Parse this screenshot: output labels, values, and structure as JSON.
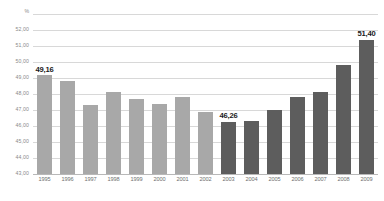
{
  "chart_data": {
    "type": "bar",
    "title": "",
    "subtitle": "",
    "xlabel": "",
    "ylabel": "",
    "unit_label": "%",
    "ylim": [
      43.0,
      53.0
    ],
    "ytick_step": 1.0,
    "ytick_labels": [
      "53,00",
      "52,00",
      "51,00",
      "50,00",
      "49,00",
      "48,00",
      "47,00",
      "46,00",
      "45,00",
      "44,00",
      "43,00"
    ],
    "ytick_values": [
      53.0,
      52.0,
      51.0,
      50.0,
      49.0,
      48.0,
      47.0,
      46.0,
      45.0,
      44.0,
      43.0
    ],
    "grid": true,
    "legend": "none",
    "decimal_separator": ",",
    "categories": [
      "1995",
      "1996",
      "1997",
      "1998",
      "1999",
      "2000",
      "2001",
      "2002",
      "2003",
      "2004",
      "2005",
      "2006",
      "2007",
      "2008",
      "2009"
    ],
    "values": [
      49.16,
      48.8,
      47.3,
      48.1,
      47.7,
      47.4,
      47.8,
      46.9,
      46.26,
      46.3,
      47.0,
      47.8,
      48.1,
      49.8,
      51.4
    ],
    "bars": [
      {
        "category": "1995",
        "value": 49.16,
        "color": "#a8a8a8",
        "group": "light",
        "label": "49,16"
      },
      {
        "category": "1996",
        "value": 48.8,
        "color": "#a8a8a8",
        "group": "light",
        "label": ""
      },
      {
        "category": "1997",
        "value": 47.3,
        "color": "#a8a8a8",
        "group": "light",
        "label": ""
      },
      {
        "category": "1998",
        "value": 48.1,
        "color": "#a8a8a8",
        "group": "light",
        "label": ""
      },
      {
        "category": "1999",
        "value": 47.7,
        "color": "#a8a8a8",
        "group": "light",
        "label": ""
      },
      {
        "category": "2000",
        "value": 47.4,
        "color": "#a8a8a8",
        "group": "light",
        "label": ""
      },
      {
        "category": "2001",
        "value": 47.8,
        "color": "#a8a8a8",
        "group": "light",
        "label": ""
      },
      {
        "category": "2002",
        "value": 46.9,
        "color": "#a8a8a8",
        "group": "light",
        "label": ""
      },
      {
        "category": "2003",
        "value": 46.26,
        "color": "#5d5d5d",
        "group": "dark",
        "label": "46,26"
      },
      {
        "category": "2004",
        "value": 46.3,
        "color": "#5d5d5d",
        "group": "dark",
        "label": ""
      },
      {
        "category": "2005",
        "value": 47.0,
        "color": "#5d5d5d",
        "group": "dark",
        "label": ""
      },
      {
        "category": "2006",
        "value": 47.8,
        "color": "#5d5d5d",
        "group": "dark",
        "label": ""
      },
      {
        "category": "2007",
        "value": 48.1,
        "color": "#5d5d5d",
        "group": "dark",
        "label": ""
      },
      {
        "category": "2008",
        "value": 49.8,
        "color": "#5d5d5d",
        "group": "dark",
        "label": ""
      },
      {
        "category": "2009",
        "value": 51.4,
        "color": "#5d5d5d",
        "group": "dark",
        "label": "51,40"
      }
    ],
    "colors": {
      "series_light": "#a8a8a8",
      "series_dark": "#5d5d5d",
      "gridline": "#d8d8d8",
      "baseline": "#b8b8b8",
      "axis_text": "#8a8a8a",
      "data_label": "#1a1a1a",
      "background": "#ffffff"
    }
  }
}
